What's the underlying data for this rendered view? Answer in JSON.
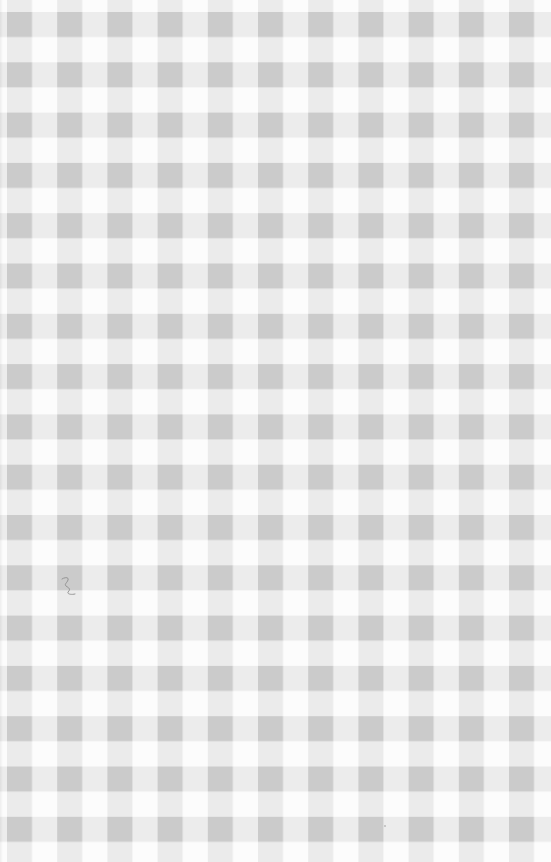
{
  "image": {
    "subject": "gingham checkered fabric texture",
    "width": 551,
    "height": 862,
    "pattern": {
      "type": "gingham",
      "period_px": 50.2,
      "stripe_width_px": 25,
      "column_offset_px": 7,
      "row_offset_px": 12
    },
    "colors": {
      "white": "#fcfcfc",
      "light_stripe": "#ececec",
      "dark_square": "#cbcbcb",
      "mark": "#8c8c8c"
    },
    "marks": [
      {
        "name": "pencil-scribble",
        "x": 62,
        "y": 577
      },
      {
        "name": "speck",
        "x": 385,
        "y": 826
      }
    ]
  }
}
